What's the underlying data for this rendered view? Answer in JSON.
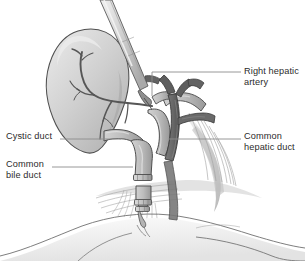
{
  "figure": {
    "background_color": "#ffffff",
    "width": 305,
    "height": 261
  },
  "labels": {
    "right_hepatic_artery": "Right hepatic\nartery",
    "common_hepatic_duct": "Common\nhepatic duct",
    "cystic_duct": "Cystic duct",
    "common_bile_duct": "Common\nbile duct"
  },
  "colors": {
    "text": "#2b2b2b",
    "leader_line": "#8d8d8d",
    "outline": "#4a4a4a",
    "gallbladder_fill": "#c9c9c9",
    "gallbladder_highlight": "#e0e0e0",
    "duct_fill": "#b8b8b8",
    "duct_shadow": "#9a9a9a",
    "artery_fill": "#6d6d6d",
    "artery_shadow": "#565656",
    "vessel_stroke": "#5a5a5a",
    "instrument_fill": "#d8d8d8",
    "instrument_shadow": "#a8a8a8",
    "clip_fill": "#c4c4c4",
    "tissue_fill": "#cfcfcf",
    "tissue_fiber": "#a5a5a5",
    "fat_fill": "#e6e6e6"
  },
  "anatomy": {
    "structures": [
      "gallbladder",
      "cystic-artery-branches",
      "cystic-duct",
      "common-bile-duct",
      "common-hepatic-duct",
      "right-hepatic-artery",
      "hepatic-duct-confluence",
      "surgical-clips",
      "dissector-instrument",
      "fibrous-tissue-bed",
      "duodenal-contour"
    ],
    "clip_count": 3
  }
}
